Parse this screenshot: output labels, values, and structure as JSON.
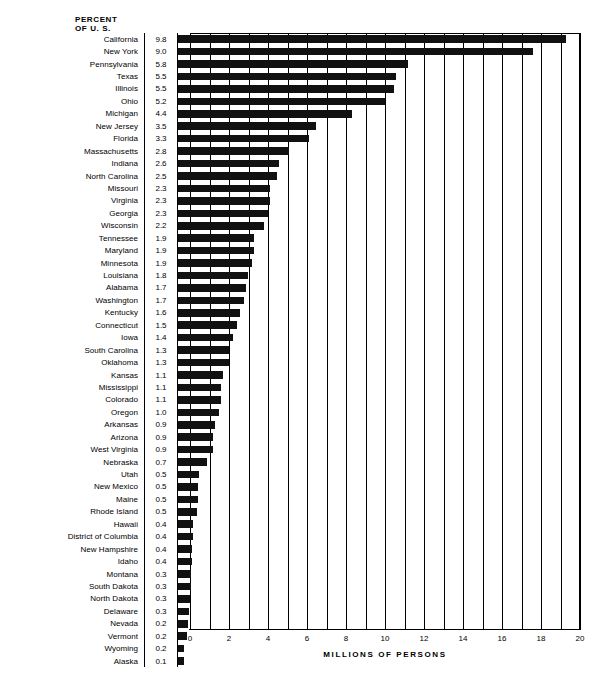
{
  "header": {
    "value_column_title_line1": "PERCENT",
    "value_column_title_line2": "OF U. S."
  },
  "axis": {
    "xlabel": "MILLIONS OF PERSONS",
    "tick_labels": [
      "0",
      "2",
      "4",
      "6",
      "8",
      "10",
      "12",
      "14",
      "16",
      "18",
      "20"
    ]
  },
  "chart_data": {
    "type": "bar",
    "orientation": "horizontal",
    "title": "",
    "xlabel": "MILLIONS OF PERSONS",
    "ylabel": "",
    "xlim": [
      0,
      20
    ],
    "xticks": [
      0,
      2,
      4,
      6,
      8,
      10,
      12,
      14,
      16,
      18,
      20
    ],
    "gridlines_every": 1,
    "grid": true,
    "legend": "none",
    "value_column_header": "PERCENT OF U. S.",
    "categories": [
      "California",
      "New York",
      "Pennsylvania",
      "Texas",
      "Illinois",
      "Ohio",
      "Michigan",
      "New Jersey",
      "Florida",
      "Massachusetts",
      "Indiana",
      "North Carolina",
      "Missouri",
      "Virginia",
      "Georgia",
      "Wisconsin",
      "Tennessee",
      "Maryland",
      "Minnesota",
      "Louisiana",
      "Alabama",
      "Washington",
      "Kentucky",
      "Connecticut",
      "Iowa",
      "South Carolina",
      "Oklahoma",
      "Kansas",
      "Mississippi",
      "Colorado",
      "Oregon",
      "Arkansas",
      "Arizona",
      "West Virginia",
      "Nebraska",
      "Utah",
      "New Mexico",
      "Maine",
      "Rhode Island",
      "Hawaii",
      "District of Columbia",
      "New Hampshire",
      "Idaho",
      "Montana",
      "South Dakota",
      "North Dakota",
      "Delaware",
      "Nevada",
      "Vermont",
      "Wyoming",
      "Alaska"
    ],
    "percent_of_us": [
      "9.8",
      "9.0",
      "5.8",
      "5.5",
      "5.5",
      "5.2",
      "4.4",
      "3.5",
      "3.3",
      "2.8",
      "2.6",
      "2.5",
      "2.3",
      "2.3",
      "2.3",
      "2.2",
      "1.9",
      "1.9",
      "1.9",
      "1.8",
      "1.7",
      "1.7",
      "1.6",
      "1.5",
      "1.4",
      "1.3",
      "1.3",
      "1.1",
      "1.1",
      "1.1",
      "1.0",
      "0.9",
      "0.9",
      "0.9",
      "0.7",
      "0.5",
      "0.5",
      "0.5",
      "0.5",
      "0.4",
      "0.4",
      "0.4",
      "0.4",
      "0.3",
      "0.3",
      "0.3",
      "0.3",
      "0.2",
      "0.2",
      "0.2",
      "0.1"
    ],
    "values": [
      19.9,
      18.2,
      11.8,
      11.2,
      11.1,
      10.6,
      8.9,
      7.1,
      6.7,
      5.7,
      5.2,
      5.1,
      4.7,
      4.7,
      4.6,
      4.4,
      3.9,
      3.9,
      3.8,
      3.6,
      3.5,
      3.4,
      3.2,
      3.0,
      2.8,
      2.6,
      2.6,
      2.3,
      2.2,
      2.2,
      2.1,
      1.9,
      1.8,
      1.8,
      1.5,
      1.1,
      1.0,
      1.0,
      0.95,
      0.77,
      0.76,
      0.74,
      0.73,
      0.69,
      0.67,
      0.62,
      0.55,
      0.49,
      0.45,
      0.33,
      0.3
    ],
    "unit": "millions of persons"
  }
}
